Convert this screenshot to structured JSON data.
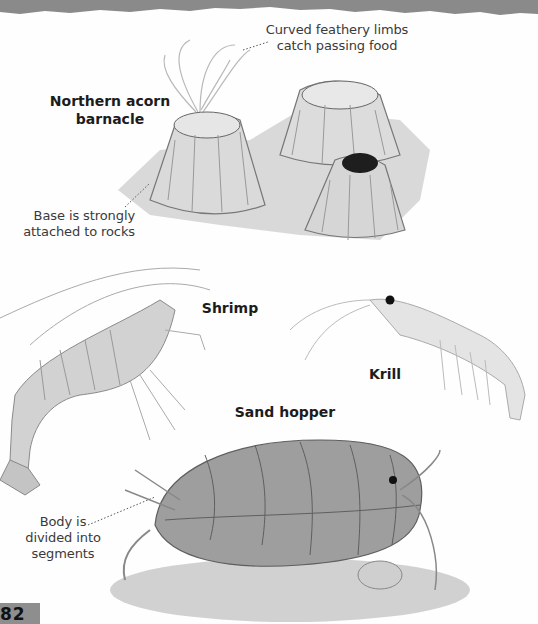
{
  "page": {
    "page_number": "82",
    "background": "#fefefe",
    "header_band_color": "#8a8a8a"
  },
  "barnacle": {
    "title_line1": "Northern acorn",
    "title_line2": "barnacle",
    "annotation_limbs_line1": "Curved feathery limbs",
    "annotation_limbs_line2": "catch passing food",
    "annotation_base_line1": "Base is strongly",
    "annotation_base_line2": "attached to rocks"
  },
  "shrimp": {
    "title": "Shrimp"
  },
  "krill": {
    "title": "Krill"
  },
  "sand_hopper": {
    "title": "Sand hopper",
    "annotation_line1": "Body is",
    "annotation_line2": "divided into",
    "annotation_line3": "segments"
  }
}
